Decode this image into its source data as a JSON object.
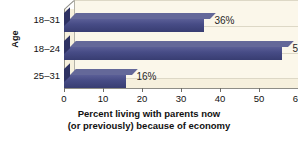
{
  "chart_data": {
    "type": "bar",
    "orientation": "horizontal",
    "categories": [
      "18–31",
      "18–24",
      "25–31"
    ],
    "values": [
      36,
      56,
      16
    ],
    "data_labels": [
      "36%",
      "56%",
      "16%"
    ],
    "title": "",
    "xlabel_line1": "Percent living with parents now",
    "xlabel_line2": "(or previously) because of economy",
    "ylabel": "Age",
    "xlim": [
      0,
      60
    ],
    "xticks": [
      0,
      10,
      20,
      30,
      40,
      50,
      60
    ],
    "xtick_labels": [
      "0",
      "10",
      "20",
      "30",
      "40",
      "50",
      "60"
    ],
    "grid": true,
    "legend": false,
    "style_3d": true,
    "colors": {
      "bar_front": "#474c86",
      "bar_top": "#646899",
      "bar_side": "#2e3263",
      "plot_background": "#f6f0dd",
      "back_wall": "#fbf7ea",
      "gridline": "#ddd8c6",
      "axis": "#8e8d86",
      "text": "#111111",
      "page_background": "#ffffff"
    }
  }
}
